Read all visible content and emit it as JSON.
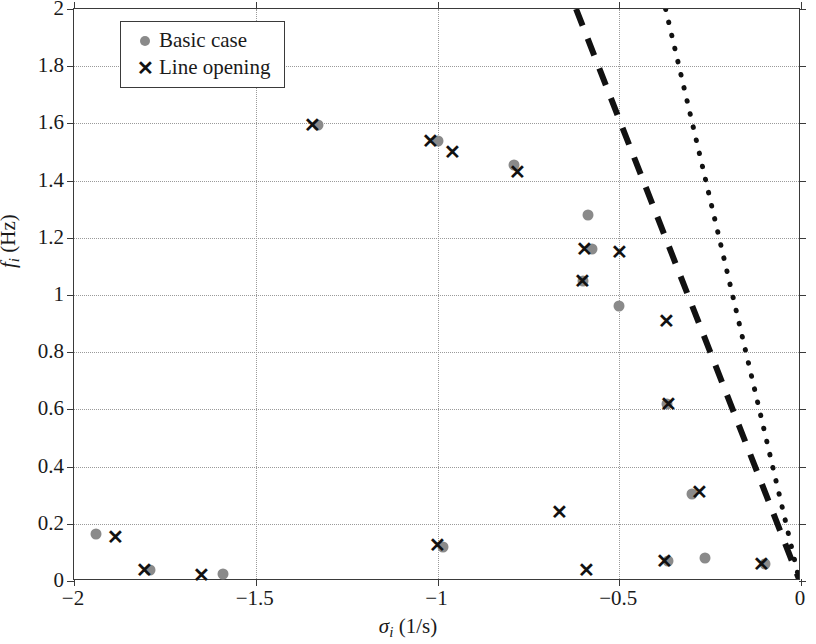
{
  "chart_data": {
    "type": "scatter",
    "title": "",
    "xlabel": "σ_i (1/s)",
    "ylabel": "f_i (Hz)",
    "xlim": [
      -2,
      0
    ],
    "ylim": [
      0,
      2
    ],
    "xticks": [
      -2,
      -1.5,
      -1,
      -0.5,
      0
    ],
    "xtick_labels": [
      "−2",
      "−1.5",
      "−1",
      "−0.5",
      "0"
    ],
    "yticks": [
      0,
      0.2,
      0.4,
      0.6,
      0.8,
      1,
      1.2,
      1.4,
      1.6,
      1.8,
      2
    ],
    "ytick_labels": [
      "0",
      "0.2",
      "0.4",
      "0.6",
      "0.8",
      "1",
      "1.2",
      "1.4",
      "1.6",
      "1.8",
      "2"
    ],
    "grid": true,
    "legend_position": "top-left",
    "series": [
      {
        "name": "Basic case",
        "marker": "dot",
        "color": "#8a8a8a",
        "points": [
          [
            -1.94,
            0.165
          ],
          [
            -1.79,
            0.04
          ],
          [
            -1.59,
            0.025
          ],
          [
            -1.33,
            1.595
          ],
          [
            -1.0,
            1.54
          ],
          [
            -0.985,
            0.12
          ],
          [
            -0.79,
            1.455
          ],
          [
            -0.585,
            1.28
          ],
          [
            -0.575,
            1.16
          ],
          [
            -0.6,
            1.05
          ],
          [
            -0.5,
            0.96
          ],
          [
            -0.37,
            0.62
          ],
          [
            -0.3,
            0.305
          ],
          [
            -0.365,
            0.07
          ],
          [
            -0.265,
            0.08
          ],
          [
            -0.1,
            0.06
          ]
        ]
      },
      {
        "name": "Line opening",
        "marker": "x",
        "color": "#111111",
        "points": [
          [
            -1.885,
            0.155
          ],
          [
            -1.805,
            0.04
          ],
          [
            -1.65,
            0.02
          ],
          [
            -1.345,
            1.595
          ],
          [
            -1.02,
            1.54
          ],
          [
            -0.96,
            1.5
          ],
          [
            -1.0,
            0.125
          ],
          [
            -0.78,
            1.43
          ],
          [
            -0.665,
            0.24
          ],
          [
            -0.595,
            1.16
          ],
          [
            -0.6,
            1.05
          ],
          [
            -0.5,
            1.15
          ],
          [
            -0.59,
            0.04
          ],
          [
            -0.37,
            0.91
          ],
          [
            -0.365,
            0.62
          ],
          [
            -0.28,
            0.31
          ],
          [
            -0.375,
            0.07
          ],
          [
            -0.11,
            0.06
          ]
        ]
      }
    ],
    "reference_lines": [
      {
        "name": "dashed-boundary",
        "style": "dashed",
        "color": "#111111",
        "from": [
          -0.615,
          2.0
        ],
        "to": [
          0.0,
          0.0
        ]
      },
      {
        "name": "dotted-boundary",
        "style": "dotted",
        "color": "#111111",
        "from": [
          -0.368,
          2.0
        ],
        "to": [
          0.0,
          0.0
        ]
      }
    ]
  },
  "legend": {
    "items": [
      {
        "label": "Basic case",
        "marker": "dot-marker"
      },
      {
        "label": "Line opening",
        "marker": "x-marker"
      }
    ]
  },
  "axis_titles": {
    "x_symbol": "σ",
    "x_sub": "i",
    "x_unit": "(1/s)",
    "y_symbol": "f",
    "y_sub": "i",
    "y_unit": "(Hz)"
  }
}
